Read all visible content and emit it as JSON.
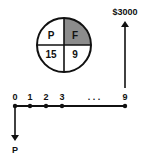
{
  "diagram": {
    "type": "cash-flow-diagram",
    "factor_pie": {
      "quadrants": {
        "top_left": "P",
        "top_right": "F",
        "bottom_left": "15",
        "bottom_right": "9"
      },
      "shaded_quadrant": "top_right",
      "shade_color": "#8c8c8c"
    },
    "timeline": {
      "period_labels": [
        "0",
        "1",
        "2",
        "3",
        "9"
      ],
      "ellipsis": ". . ."
    },
    "cash_flows": {
      "inflow_label": "$3000",
      "inflow_period": "9",
      "outflow_label": "P",
      "outflow_period": "0"
    }
  }
}
